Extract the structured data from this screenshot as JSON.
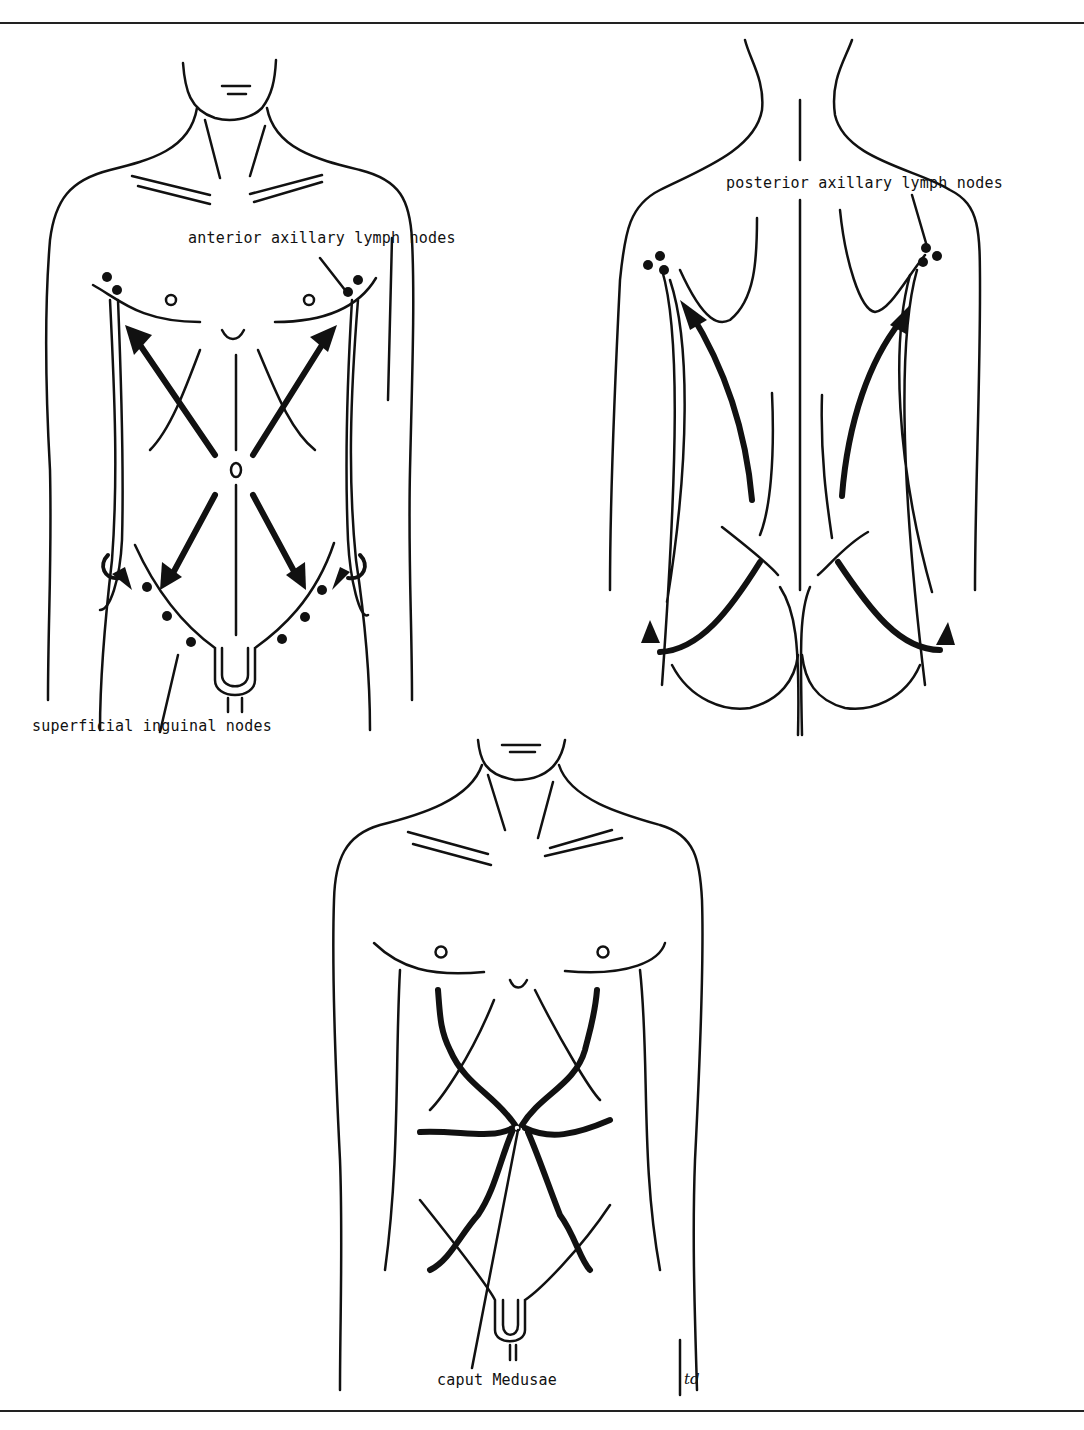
{
  "figure": {
    "panels": [
      {
        "id": "anterior",
        "description": "Anterior torso: lymphatic drainage arrows from umbilicus to axillary and inguinal nodes"
      },
      {
        "id": "posterior",
        "description": "Posterior torso: lymphatic drainage arrows to posterior axillary and inguinal nodes"
      },
      {
        "id": "venous",
        "description": "Anterior torso showing caput Medusae radiating veins from umbilicus"
      }
    ],
    "labels": {
      "anterior_axillary": "anterior axillary lymph nodes",
      "posterior_axillary": "posterior axillary lymph nodes",
      "superficial_inguinal": "superficial inguinal nodes",
      "caput_medusae": "caput Medusae",
      "signature": "td"
    },
    "colors": {
      "ink": "#111111",
      "background": "#ffffff"
    }
  }
}
